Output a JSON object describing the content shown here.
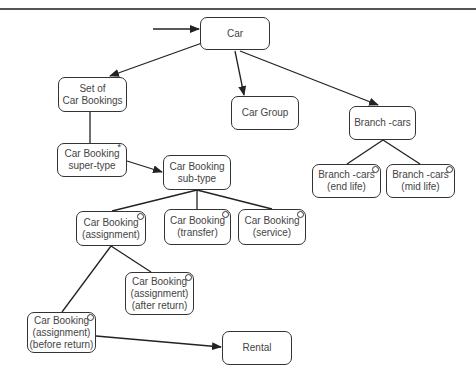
{
  "diagram": {
    "type": "entity-hierarchy",
    "nodes": {
      "car": {
        "lines": [
          "Car"
        ]
      },
      "set_of_car_bookings": {
        "lines": [
          "Set of",
          "Car Bookings"
        ]
      },
      "car_group": {
        "lines": [
          "Car Group"
        ]
      },
      "branch_cars": {
        "lines": [
          "Branch -cars"
        ]
      },
      "car_booking_super_type": {
        "lines": [
          "Car Booking",
          "super-type"
        ],
        "marker": "*"
      },
      "car_booking_sub_type": {
        "lines": [
          "Car Booking",
          "sub-type"
        ]
      },
      "branch_cars_end_life": {
        "lines": [
          "Branch -cars",
          "(end life)"
        ],
        "marker": "o"
      },
      "branch_cars_mid_life": {
        "lines": [
          "Branch -cars",
          "(mid life)"
        ],
        "marker": "o"
      },
      "car_booking_assignment": {
        "lines": [
          "Car Booking",
          "(assignment)"
        ],
        "marker": "o"
      },
      "car_booking_transfer": {
        "lines": [
          "Car Booking",
          "(transfer)"
        ],
        "marker": "o"
      },
      "car_booking_service": {
        "lines": [
          "Car Booking",
          "(service)"
        ],
        "marker": "o"
      },
      "car_booking_after_return": {
        "lines": [
          "Car Booking",
          "(assignment)",
          "(after return)"
        ],
        "marker": "o"
      },
      "car_booking_before_return": {
        "lines": [
          "Car Booking",
          "(assignment)",
          "(before return)"
        ],
        "marker": "o"
      },
      "rental": {
        "lines": [
          "Rental"
        ]
      }
    },
    "edges": [
      {
        "from": "entry",
        "to": "car",
        "arrow": true
      },
      {
        "from": "car",
        "to": "set_of_car_bookings",
        "arrow": true
      },
      {
        "from": "car",
        "to": "car_group",
        "arrow": true
      },
      {
        "from": "car",
        "to": "branch_cars",
        "arrow": true
      },
      {
        "from": "set_of_car_bookings",
        "to": "car_booking_super_type",
        "arrow": false
      },
      {
        "from": "car_booking_super_type",
        "to": "car_booking_sub_type",
        "arrow": true
      },
      {
        "from": "car_booking_sub_type",
        "to": "car_booking_assignment",
        "arrow": false
      },
      {
        "from": "car_booking_sub_type",
        "to": "car_booking_transfer",
        "arrow": false
      },
      {
        "from": "car_booking_sub_type",
        "to": "car_booking_service",
        "arrow": false
      },
      {
        "from": "branch_cars",
        "to": "branch_cars_end_life",
        "arrow": false
      },
      {
        "from": "branch_cars",
        "to": "branch_cars_mid_life",
        "arrow": false
      },
      {
        "from": "car_booking_assignment",
        "to": "car_booking_after_return",
        "arrow": false
      },
      {
        "from": "car_booking_assignment",
        "to": "car_booking_before_return",
        "arrow": false
      },
      {
        "from": "car_booking_before_return",
        "to": "rental",
        "arrow": true
      }
    ]
  }
}
